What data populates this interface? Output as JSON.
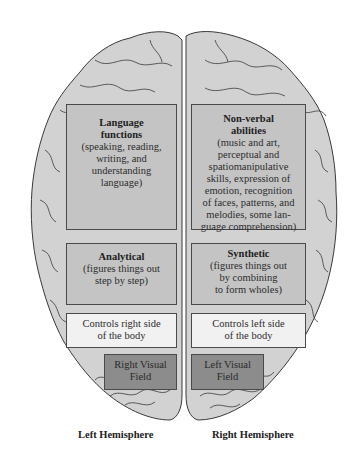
{
  "diagram": {
    "left_hemisphere": {
      "label": "Left Hemisphere",
      "boxes": [
        {
          "title": "Language functions",
          "title_line1": "Language",
          "title_line2": "functions",
          "desc_lines": [
            "(speaking, reading,",
            "writing, and",
            "understanding",
            "language)"
          ]
        },
        {
          "title": "Analytical",
          "desc_lines": [
            "(figures things out",
            "step by step)"
          ]
        },
        {
          "text_lines": [
            "Controls right side",
            "of the body"
          ]
        },
        {
          "text_lines": [
            "Right Visual",
            "Field"
          ]
        }
      ]
    },
    "right_hemisphere": {
      "label": "Right Hemisphere",
      "boxes": [
        {
          "title": "Non-verbal abilities",
          "title_line1": "Non-verbal",
          "title_line2": "abilities",
          "desc_lines": [
            "(music and art,",
            "perceptual and",
            "spatiomanipulative",
            "skills, expression of",
            "emotion, recognition",
            "of faces, patterns, and",
            "melodies, some lan-",
            "guage comprehension)"
          ]
        },
        {
          "title": "Synthetic",
          "desc_lines": [
            "(figures things out",
            "by combining",
            "to form wholes)"
          ]
        },
        {
          "text_lines": [
            "Controls left side",
            "of the body"
          ]
        },
        {
          "text_lines": [
            "Left Visual",
            "Field"
          ]
        }
      ]
    },
    "colors": {
      "brain_fill": "#d2d2d2",
      "brain_outline": "#3a3a3a",
      "box_mid": "#c4c4c4",
      "box_light": "#f1f1f1",
      "box_dark": "#8c8c8c"
    }
  }
}
